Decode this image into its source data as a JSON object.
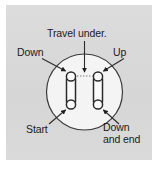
{
  "figure": {
    "type": "knitting-stitch-diagram",
    "background_color": "#ffffff",
    "panel_color": "#d8d8d8",
    "line_color": "#2b2b2b",
    "circle_fill": "#f2f2f2",
    "labels": {
      "travel_under": "Travel under.",
      "down": "Down",
      "up": "Up",
      "start": "Start",
      "down_and_end_line1": "Down",
      "down_and_end_line2": "and end"
    },
    "elements": {
      "circle_label": "needle-path-circle",
      "loop_left_label": "left-stitch-loop",
      "loop_right_label": "right-stitch-loop"
    }
  }
}
